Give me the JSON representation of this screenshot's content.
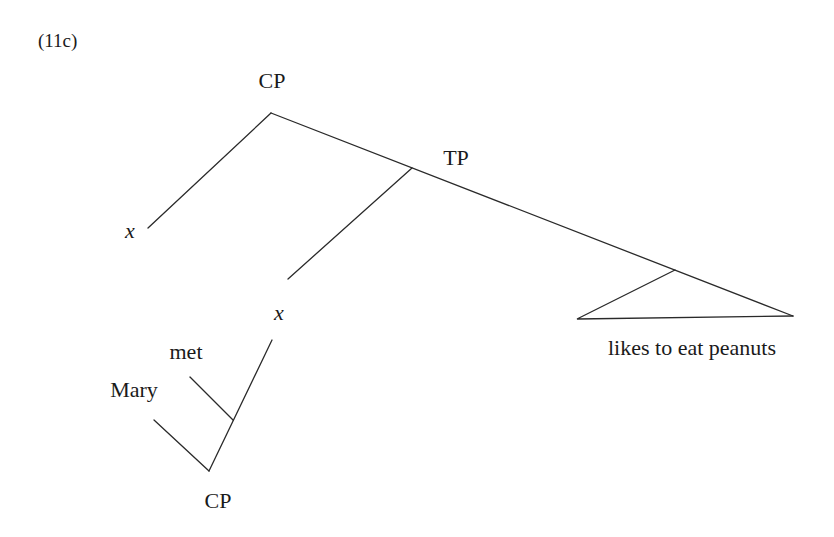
{
  "example_label": "(11c)",
  "tree": {
    "root": {
      "label": "CP"
    },
    "spec_x": {
      "label": "x"
    },
    "tp": {
      "label": "TP"
    },
    "subject_x": {
      "label": "x"
    },
    "predicate": {
      "label": "likes to eat peanuts"
    },
    "relative_clause": {
      "verb": {
        "label": "met"
      },
      "subject": {
        "label": "Mary"
      },
      "cp": {
        "label": "CP"
      }
    }
  },
  "colors": {
    "line": "#2a2a2a",
    "text": "#1a1a1a",
    "background": "#ffffff"
  }
}
